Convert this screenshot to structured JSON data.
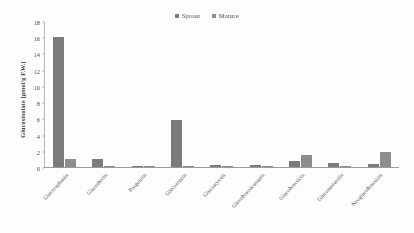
{
  "chart_data": {
    "type": "bar",
    "title": "",
    "xlabel": "",
    "ylabel": "Glucosinolate [µmol/g F.W.]",
    "ylim": [
      0,
      18
    ],
    "ytick_values": [
      18,
      16,
      14,
      12,
      10,
      8,
      6,
      4,
      2,
      0
    ],
    "grid": false,
    "legend_position": "top-center",
    "categories": [
      "Glucoraphanin",
      "Glucoiberin",
      "Progoitrin",
      "Glucoerucin",
      "Glucoalyssin",
      "Glucobrassicanapin",
      "Glucobrassicin",
      "Gluconasturtiin",
      "Neoglucobrassicin"
    ],
    "series": [
      {
        "name": "Sprout",
        "color": "#7b7b7b",
        "values": [
          16.2,
          1.0,
          0.05,
          5.8,
          0.3,
          0.3,
          0.7,
          0.55,
          0.4
        ]
      },
      {
        "name": "Mature",
        "color": "#8d8d8d",
        "values": [
          1.0,
          0.1,
          0.03,
          0.15,
          0.05,
          0.05,
          1.5,
          0.1,
          1.9
        ]
      }
    ]
  },
  "legend": {
    "items": [
      {
        "label": "Sprout",
        "color": "#7b7b7b"
      },
      {
        "label": "Mature",
        "color": "#8d8d8d"
      }
    ]
  }
}
